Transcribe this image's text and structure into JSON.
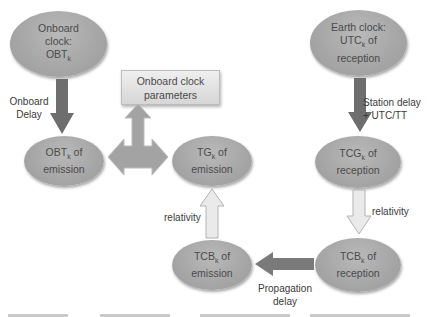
{
  "diagram": {
    "nodes": {
      "onboard_clock": {
        "lines": [
          "Onboard",
          "clock:",
          "OBT"
        ],
        "sub": "k"
      },
      "obt_emission": {
        "lines": [
          "OBT",
          "emission"
        ],
        "sub": "k",
        "suffix": " of"
      },
      "clock_params": {
        "lines": [
          "Onboard clock",
          "parameters"
        ]
      },
      "tg_emission": {
        "lines": [
          "TG",
          "emission"
        ],
        "sub": "k",
        "suffix": " of"
      },
      "earth_clock": {
        "lines": [
          "Earth clock:",
          "UTC",
          "reception"
        ],
        "sub": "k",
        "suffix": " of"
      },
      "tcg_reception": {
        "lines": [
          "TCG",
          "reception"
        ],
        "sub": "k",
        "suffix": " of"
      },
      "tcb_reception": {
        "lines": [
          "TCB",
          "reception"
        ],
        "sub": "k",
        "suffix": " of"
      },
      "tcb_emission": {
        "lines": [
          "TCB",
          "emission"
        ],
        "sub": "k",
        "suffix": " of"
      }
    },
    "edges": {
      "onboard_delay": {
        "lines": [
          "Onboard",
          "Delay"
        ]
      },
      "station_delay": {
        "lines": [
          "Station delay",
          "+ UTC/TT"
        ]
      },
      "relativity_right": {
        "label": "relativity"
      },
      "relativity_left": {
        "label": "relativity"
      },
      "propagation_delay": {
        "lines": [
          "Propagation",
          "delay"
        ]
      }
    },
    "colors": {
      "ellipse_fill": "#a7a7a7",
      "dark_arrow": "#6e6e6e",
      "mid_arrow": "#9e9e9e",
      "light_arrow": "#e4e4e4",
      "box_fill": "#e2e2e2",
      "text": "#4a4a4a"
    }
  }
}
